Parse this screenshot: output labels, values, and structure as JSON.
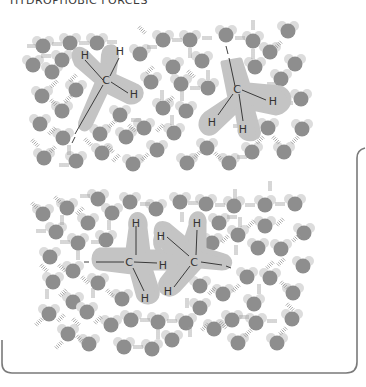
{
  "title": "HYDROPHOBIC FORCES",
  "colors": {
    "oxygen": "#8e8e8e",
    "hydrogen": "#dcdcdc",
    "halo": "#c4c4c4",
    "bond": "#2a2a2a",
    "hbond": "#9a9a9a",
    "frame": "#7a7a7a",
    "label": "#333333"
  },
  "panels": [
    {
      "name": "separated",
      "description": "Two methane molecules separated in water",
      "molecules": [
        {
          "type": "methane",
          "center_label": "C",
          "hydrogen_labels": [
            "H",
            "H",
            "H",
            "H"
          ]
        },
        {
          "type": "methane",
          "center_label": "C",
          "hydrogen_labels": [
            "H",
            "H",
            "H",
            "H"
          ]
        }
      ]
    },
    {
      "name": "aggregated",
      "description": "Two methane molecules clustered together in water",
      "molecules": [
        {
          "type": "methane",
          "center_label": "C",
          "hydrogen_labels": [
            "H",
            "H",
            "H",
            "H"
          ]
        },
        {
          "type": "methane",
          "center_label": "C",
          "hydrogen_labels": [
            "H",
            "H",
            "H",
            "H"
          ]
        }
      ]
    }
  ],
  "labels": {
    "c": "C",
    "h": "H"
  }
}
